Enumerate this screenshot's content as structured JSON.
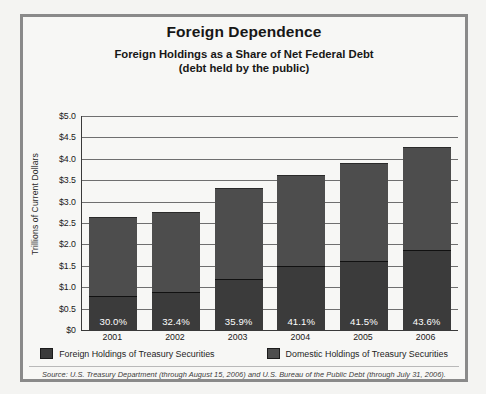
{
  "chart_data": {
    "type": "bar",
    "title": "Foreign Dependence",
    "subtitle_line1": "Foreign Holdings as a Share of Net Federal Debt",
    "subtitle_line2": "(debt held by the public)",
    "xlabel": "",
    "ylabel": "Trillions of Current Dollars",
    "ylim": [
      0,
      5.0
    ],
    "ytick_labels": [
      "$5.0",
      "$4.5",
      "$4.0",
      "$3.5",
      "$3.0",
      "$2.5",
      "$2.0",
      "$1.5",
      "$1.0",
      "$0.5",
      "$0"
    ],
    "ytick_values": [
      5.0,
      4.5,
      4.0,
      3.5,
      3.0,
      2.5,
      2.0,
      1.5,
      1.0,
      0.5,
      0
    ],
    "grid": true,
    "legend_position": "bottom",
    "stacked": true,
    "categories": [
      "2001",
      "2002",
      "2003",
      "2004",
      "2005",
      "2006"
    ],
    "series": [
      {
        "name": "Foreign Holdings of Treasury Securities",
        "color": "#3b3b3b",
        "values": [
          0.8,
          0.89,
          1.19,
          1.49,
          1.62,
          1.86
        ]
      },
      {
        "name": "Domestic Holdings of Treasury Securities",
        "color": "#4d4d4d",
        "values": [
          1.85,
          1.86,
          2.12,
          2.14,
          2.28,
          2.41
        ]
      }
    ],
    "totals": [
      2.65,
      2.75,
      3.31,
      3.63,
      3.9,
      4.27
    ],
    "data_labels": [
      "30.0%",
      "32.4%",
      "35.9%",
      "41.1%",
      "41.5%",
      "43.6%"
    ],
    "annotation_source": "Source: U.S. Treasury Department (through August 15, 2006) and U.S. Bureau of the Public Debt (through July 31, 2006)."
  }
}
